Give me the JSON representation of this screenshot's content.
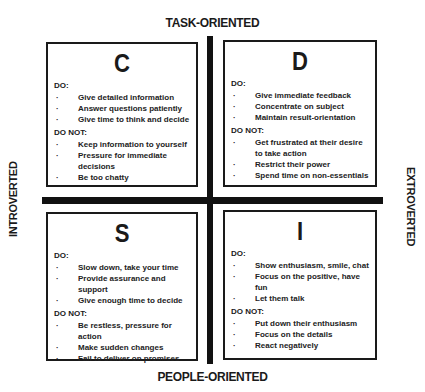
{
  "axes": {
    "top": "TASK-ORIENTED",
    "bottom": "PEOPLE-ORIENTED",
    "left": "INTROVERTED",
    "right": "EXTROVERTED"
  },
  "quadrants": {
    "c": {
      "letter": "C",
      "do_label": "DO:",
      "do": [
        "Give detailed information",
        "Answer questions patiently",
        "Give time to think and decide"
      ],
      "dont_label": "DO NOT:",
      "dont": [
        "Keep information to yourself",
        "Pressure for immediate decisions",
        "Be too chatty"
      ]
    },
    "d": {
      "letter": "D",
      "do_label": "DO:",
      "do": [
        "Give immediate feedback",
        "Concentrate on subject",
        "Maintain result-orientation"
      ],
      "dont_label": "DO NOT:",
      "dont": [
        "Get frustrated at their desire to take action",
        "Restrict their power",
        "Spend time on non-essentials"
      ]
    },
    "s": {
      "letter": "S",
      "do_label": "DO:",
      "do": [
        "Slow down, take your time",
        "Provide assurance and support",
        "Give enough time to decide"
      ],
      "dont_label": "DO NOT:",
      "dont": [
        "Be restless, pressure for action",
        "Make sudden changes",
        "Fail to deliver on promises"
      ]
    },
    "i": {
      "letter": "I",
      "do_label": "DO:",
      "do": [
        "Show enthusiasm, smile, chat",
        "Focus on the positive, have fun",
        "Let them talk"
      ],
      "dont_label": "DO NOT:",
      "dont": [
        "Put down their enthusiasm",
        "Focus on the details",
        "React negatively"
      ]
    }
  }
}
